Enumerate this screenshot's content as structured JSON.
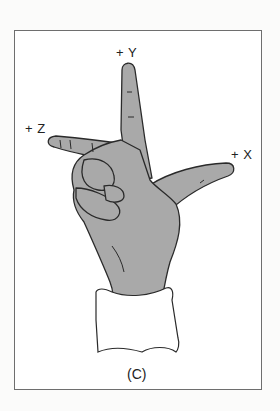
{
  "figure": {
    "caption": "(C)",
    "axes": {
      "y": "+ Y",
      "z": "+ Z",
      "x": "+ X"
    },
    "colors": {
      "skin": "#a9a9a9",
      "outline": "#2a2a2a",
      "sleeve": "#ffffff",
      "frame": "#6e6e6e"
    }
  }
}
